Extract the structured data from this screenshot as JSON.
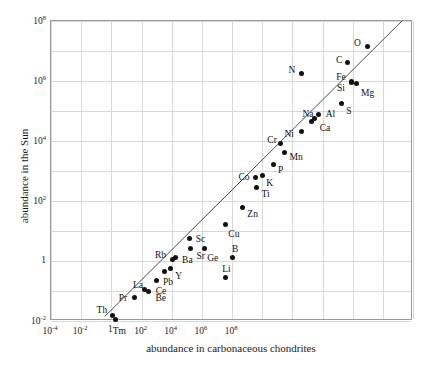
{
  "chart_data": {
    "type": "scatter",
    "title": "",
    "xlabel": "abundance in carbonaceous chondrites",
    "ylabel": "abundance in the Sun",
    "xscale": "log",
    "yscale": "log",
    "xlim": [
      0.0001,
      100000000.0
    ],
    "ylim": [
      0.01,
      100000000.0
    ],
    "grid": true,
    "legend": "none",
    "xticks": [
      "10-4",
      "10-2",
      "1",
      "102",
      "104",
      "106",
      "108"
    ],
    "xtick_mantissa": [
      "10",
      "10",
      "1",
      "10",
      "10",
      "10",
      "10"
    ],
    "xtick_exponent": [
      "-4",
      "-2",
      "",
      "2",
      "4",
      "6",
      "8"
    ],
    "ytick_mantissa": [
      "10",
      "10",
      "10",
      "10",
      "1",
      "10"
    ],
    "ytick_exponent": [
      "8",
      "6",
      "4",
      "2",
      "",
      "-2"
    ],
    "annotation_line": {
      "description": "one-to-one correlation guide line",
      "x_start": 0.006,
      "y_start": 0.014,
      "x_end": 60000000.0,
      "y_end": 140000000.0
    },
    "points": [
      {
        "label": "O",
        "x": 3000000.0,
        "y": 14000000.0,
        "lx": -13,
        "ly": -3
      },
      {
        "label": "C",
        "x": 700000.0,
        "y": 4000000.0,
        "lx": -12,
        "ly": -2
      },
      {
        "label": "N",
        "x": 20000.0,
        "y": 1800000.0,
        "lx": -13,
        "ly": -2
      },
      {
        "label": "Fe",
        "x": 900000.0,
        "y": 900000.0,
        "lx": -15,
        "ly": -4
      },
      {
        "label": "Si",
        "x": 950000.0,
        "y": 950000.0,
        "lx": -15,
        "ly": 7
      },
      {
        "label": "Mg",
        "x": 1300000.0,
        "y": 800000.0,
        "lx": 5,
        "ly": 10
      },
      {
        "label": "S",
        "x": 420000.0,
        "y": 180000.0,
        "lx": 5,
        "ly": 9
      },
      {
        "label": "Na",
        "x": 43000.0,
        "y": 43000.0,
        "lx": -9,
        "ly": -7
      },
      {
        "label": "Al",
        "x": 75000.0,
        "y": 75000.0,
        "lx": 7,
        "ly": 0
      },
      {
        "label": "Ca",
        "x": 55000.0,
        "y": 55000.0,
        "lx": 5,
        "ly": 10
      },
      {
        "label": "Ni",
        "x": 20000.0,
        "y": 20000.0,
        "lx": -17,
        "ly": 3
      },
      {
        "label": "Cr",
        "x": 4000.0,
        "y": 8000.0,
        "lx": -13,
        "ly": -3
      },
      {
        "label": "Mn",
        "x": 5500.0,
        "y": 4000.0,
        "lx": 5,
        "ly": 5
      },
      {
        "label": "P",
        "x": 2300.0,
        "y": 1600.0,
        "lx": 5,
        "ly": 6
      },
      {
        "label": "K",
        "x": 1000.0,
        "y": 700.0,
        "lx": 4,
        "ly": 8
      },
      {
        "label": "Co",
        "x": 600.0,
        "y": 600.0,
        "lx": -17,
        "ly": 0
      },
      {
        "label": "Ti",
        "x": 650.0,
        "y": 280.0,
        "lx": 5,
        "ly": 7
      },
      {
        "label": "Zn",
        "x": 220.0,
        "y": 60.0,
        "lx": 5,
        "ly": 7
      },
      {
        "label": "Cu",
        "x": 60.0,
        "y": 16.0,
        "lx": 3,
        "ly": 10
      },
      {
        "label": "Ge",
        "x": 12.0,
        "y": 2.6,
        "lx": 3,
        "ly": 10
      },
      {
        "label": "Sc",
        "x": 4.0,
        "y": 5.5,
        "lx": 6,
        "ly": 1
      },
      {
        "label": "Sr",
        "x": 4.2,
        "y": 2.6,
        "lx": 6,
        "ly": 8
      },
      {
        "label": "B",
        "x": 100.0,
        "y": 1.3,
        "lx": 0,
        "ly": -8
      },
      {
        "label": "Rb",
        "x": 1.1,
        "y": 1.1,
        "lx": -18,
        "ly": -4
      },
      {
        "label": "Ba",
        "x": 1.3,
        "y": 1.3,
        "lx": 7,
        "ly": 3
      },
      {
        "label": "Y",
        "x": 0.9,
        "y": 0.55,
        "lx": 5,
        "ly": 8
      },
      {
        "label": "Pb",
        "x": 0.6,
        "y": 0.45,
        "lx": -2,
        "ly": 12
      },
      {
        "label": "Ce",
        "x": 0.32,
        "y": 0.22,
        "lx": -1,
        "ly": 11
      },
      {
        "label": "La",
        "x": 0.13,
        "y": 0.11,
        "lx": -12,
        "ly": -4
      },
      {
        "label": "Be",
        "x": 0.17,
        "y": 0.1,
        "lx": 7,
        "ly": 8
      },
      {
        "label": "Pr",
        "x": 0.06,
        "y": 0.06,
        "lx": -16,
        "ly": 1
      },
      {
        "label": "Li",
        "x": 60.0,
        "y": 0.28,
        "lx": -3,
        "ly": -8
      },
      {
        "label": "Th",
        "x": 0.011,
        "y": 0.015,
        "lx": -16,
        "ly": -5
      },
      {
        "label": "Tm",
        "x": 0.014,
        "y": 0.011,
        "lx": -3,
        "ly": 12
      }
    ]
  }
}
